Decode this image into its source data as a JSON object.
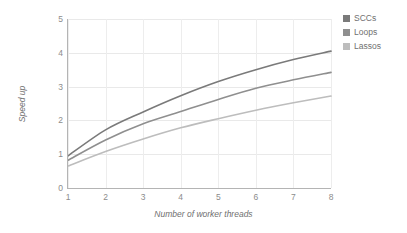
{
  "chart_data": {
    "type": "line",
    "title": "",
    "xlabel": "Number of worker threads",
    "ylabel": "Speed up",
    "x": [
      1,
      2,
      3,
      4,
      5,
      6,
      7,
      8
    ],
    "xlim": [
      1,
      8
    ],
    "ylim": [
      0,
      5
    ],
    "xticks": [
      "1",
      "2",
      "3",
      "4",
      "5",
      "6",
      "7",
      "8"
    ],
    "yticks": [
      "0",
      "1",
      "2",
      "3",
      "4",
      "5"
    ],
    "grid": true,
    "legend_position": "top-right-outside",
    "series": [
      {
        "name": "SCCs",
        "color": "#7a7a7a",
        "values": [
          0.95,
          1.72,
          2.25,
          2.73,
          3.15,
          3.5,
          3.8,
          4.05
        ]
      },
      {
        "name": "Loops",
        "color": "#8f8f8f",
        "values": [
          0.82,
          1.42,
          1.9,
          2.26,
          2.62,
          2.95,
          3.2,
          3.42
        ]
      },
      {
        "name": "Lassos",
        "color": "#bdbdbd",
        "values": [
          0.65,
          1.08,
          1.45,
          1.78,
          2.05,
          2.3,
          2.52,
          2.72
        ]
      }
    ]
  },
  "legend": {
    "items": [
      {
        "label": "SCCs",
        "color": "#7a7a7a"
      },
      {
        "label": "Loops",
        "color": "#8f8f8f"
      },
      {
        "label": "Lassos",
        "color": "#bdbdbd"
      }
    ]
  }
}
